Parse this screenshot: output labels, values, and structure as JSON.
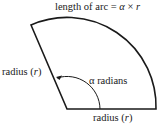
{
  "diagram": {
    "title": "length of arc = α × r",
    "title_parts": {
      "prefix": "length of arc = ",
      "alpha": "α",
      "times": " × ",
      "r": "r"
    },
    "left_radius_label": {
      "prefix": "radius (",
      "var": "r",
      "suffix": ")"
    },
    "bottom_radius_label": {
      "prefix": "radius (",
      "var": "r",
      "suffix": ")"
    },
    "angle_label": "α radians",
    "stroke_color": "#1a1a1a",
    "background": "#ffffff"
  }
}
